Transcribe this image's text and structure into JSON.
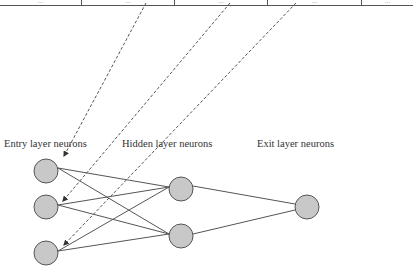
{
  "table_strip": {
    "cells": [
      "...",
      "...",
      "...",
      "...",
      "..."
    ]
  },
  "labels": {
    "entry": "Entry layer neurons",
    "hidden": "Hidden layer neurons",
    "exit": "Exit layer neurons"
  },
  "colors": {
    "node_fill": "#c8c8c8",
    "node_stroke": "#555555",
    "edge": "#555555",
    "dashed": "#555555"
  },
  "layers": {
    "entry": [
      {
        "cx": 46,
        "cy": 171
      },
      {
        "cx": 46,
        "cy": 207
      },
      {
        "cx": 46,
        "cy": 253
      }
    ],
    "hidden": [
      {
        "cx": 181,
        "cy": 189
      },
      {
        "cx": 181,
        "cy": 236
      }
    ],
    "exit": [
      {
        "cx": 307,
        "cy": 207
      }
    ]
  }
}
